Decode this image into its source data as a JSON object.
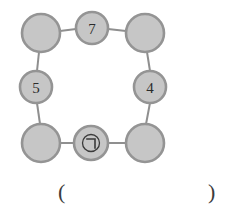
{
  "diagram": {
    "type": "ring-of-circles-puzzle",
    "shape": "square-ring",
    "node_count": 8,
    "colors": {
      "node_fill": "#c6c6c6",
      "node_stroke": "#949494",
      "edge_line": "#8f8f8f",
      "label_text": "#2b2b2b",
      "background": "#ffffff"
    },
    "nodes": [
      {
        "id": "top-left",
        "label": "",
        "kind": "corner",
        "filled": false,
        "cx": 41,
        "cy": 33,
        "r": 19
      },
      {
        "id": "top-center",
        "label": "7",
        "kind": "edge",
        "filled": true,
        "cx": 92,
        "cy": 28,
        "r": 16
      },
      {
        "id": "top-right",
        "label": "",
        "kind": "corner",
        "filled": false,
        "cx": 145,
        "cy": 33,
        "r": 19
      },
      {
        "id": "middle-left",
        "label": "5",
        "kind": "edge",
        "filled": true,
        "cx": 36,
        "cy": 87,
        "r": 16
      },
      {
        "id": "middle-right",
        "label": "4",
        "kind": "edge",
        "filled": true,
        "cx": 150,
        "cy": 87,
        "r": 16
      },
      {
        "id": "bottom-left",
        "label": "",
        "kind": "corner",
        "filled": false,
        "cx": 41,
        "cy": 143,
        "r": 19
      },
      {
        "id": "bottom-center",
        "label": "",
        "kind": "edge",
        "filled": false,
        "cx": 91,
        "cy": 143,
        "r": 17,
        "marker": "circled-giyeok"
      },
      {
        "id": "bottom-right",
        "label": "",
        "kind": "corner",
        "filled": false,
        "cx": 145,
        "cy": 143,
        "r": 19
      }
    ],
    "edges": [
      {
        "from": "top-left",
        "to": "top-center",
        "x1": 60,
        "y1": 31,
        "x2": 76,
        "y2": 29
      },
      {
        "from": "top-center",
        "to": "top-right",
        "x1": 108,
        "y1": 29,
        "x2": 126,
        "y2": 31
      },
      {
        "from": "top-left",
        "to": "middle-left",
        "x1": 39,
        "y1": 52,
        "x2": 37,
        "y2": 71
      },
      {
        "from": "middle-left",
        "to": "bottom-left",
        "x1": 37,
        "y1": 103,
        "x2": 40,
        "y2": 124
      },
      {
        "from": "top-right",
        "to": "middle-right",
        "x1": 147,
        "y1": 52,
        "x2": 150,
        "y2": 71
      },
      {
        "from": "middle-right",
        "to": "bottom-right",
        "x1": 150,
        "y1": 103,
        "x2": 146,
        "y2": 124
      },
      {
        "from": "bottom-left",
        "to": "bottom-center",
        "x1": 60,
        "y1": 143,
        "x2": 74,
        "y2": 143
      },
      {
        "from": "bottom-center",
        "to": "bottom-right",
        "x1": 108,
        "y1": 143,
        "x2": 126,
        "y2": 143
      }
    ],
    "markers": {
      "circled_giyeok": {
        "name": "circled-giyeok-marker",
        "glyph": "㉠",
        "description": "Korean consonant giyeok enclosed in a circle",
        "node": "bottom-center"
      }
    }
  },
  "answer": {
    "open_paren": "(",
    "close_paren": ")",
    "value": "",
    "placeholder": ""
  }
}
